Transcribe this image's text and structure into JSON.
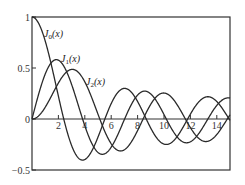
{
  "chart_data": {
    "type": "line",
    "title": "",
    "xlabel": "",
    "ylabel": "",
    "xlim": [
      0,
      15
    ],
    "ylim": [
      -0.5,
      1
    ],
    "grid": false,
    "x_ticks": [
      "2",
      "4",
      "6",
      "8",
      "10",
      "12",
      "14"
    ],
    "x_tick_values": [
      2,
      4,
      6,
      8,
      10,
      12,
      14
    ],
    "y_ticks": [
      "1",
      "0.5",
      "0",
      "-0.5"
    ],
    "y_tick_values": [
      1,
      0.5,
      0,
      -0.5
    ],
    "series": [
      {
        "name": "J0(x)",
        "label_main": "J",
        "label_sub": "0",
        "label_tail": "(x)",
        "order": 0
      },
      {
        "name": "J1(x)",
        "label_main": "J",
        "label_sub": "1",
        "label_tail": "(x)",
        "order": 1
      },
      {
        "name": "J2(x)",
        "label_main": "J",
        "label_sub": "2",
        "label_tail": "(x)",
        "order": 2
      }
    ],
    "sample_points": {
      "x": [
        0,
        1,
        2,
        3,
        4,
        5,
        6,
        7,
        8,
        9,
        10,
        11,
        12,
        13,
        14,
        15
      ],
      "J0": [
        1.0,
        0.765,
        0.224,
        -0.26,
        -0.397,
        -0.178,
        0.151,
        0.3,
        0.172,
        -0.09,
        -0.246,
        -0.171,
        0.048,
        0.207,
        0.171,
        -0.014
      ],
      "J1": [
        0.0,
        0.44,
        0.577,
        0.339,
        -0.066,
        -0.328,
        -0.277,
        -0.005,
        0.235,
        0.245,
        0.043,
        -0.177,
        -0.223,
        -0.07,
        0.133,
        0.205
      ],
      "J2": [
        0.0,
        0.115,
        0.353,
        0.486,
        0.364,
        0.047,
        -0.243,
        -0.301,
        -0.113,
        0.145,
        0.255,
        0.139,
        -0.085,
        -0.218,
        -0.152,
        0.042
      ]
    }
  }
}
